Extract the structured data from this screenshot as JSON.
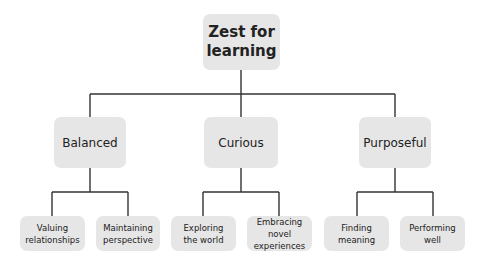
{
  "diagram": {
    "root": {
      "label": "Zest for learning",
      "line1": "Zest for",
      "line2": "learning"
    },
    "branches": [
      {
        "label": "Balanced",
        "children": [
          {
            "line1": "Valuing",
            "line2": "relationships"
          },
          {
            "line1": "Maintaining",
            "line2": "perspective"
          }
        ]
      },
      {
        "label": "Curious",
        "children": [
          {
            "line1": "Exploring",
            "line2": "the world"
          },
          {
            "line1": "Embracing novel",
            "line2": "experiences"
          }
        ]
      },
      {
        "label": "Purposeful",
        "children": [
          {
            "line1": "Finding",
            "line2": "meaning"
          },
          {
            "line1": "Performing",
            "line2": "well"
          }
        ]
      }
    ],
    "colors": {
      "box_fill": "#e6e6e6",
      "line": "#333333",
      "text": "#222222"
    }
  }
}
